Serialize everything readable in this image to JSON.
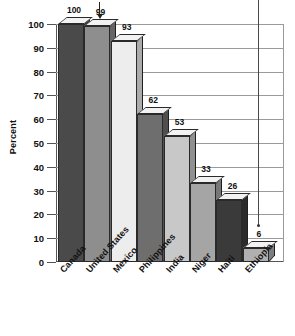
{
  "chart_data": {
    "type": "bar",
    "title": "",
    "subtitle": "",
    "xlabel": "",
    "ylabel": "Percent",
    "ylim": [
      0,
      100
    ],
    "ytick_step": 10,
    "grid": true,
    "legend": "none",
    "style": "3d-column",
    "categories": [
      "Canada",
      "United States",
      "Mexico",
      "Philippines",
      "India",
      "Niger",
      "Haiti",
      "Ethiopia"
    ],
    "values": [
      100,
      99,
      93,
      62,
      53,
      33,
      26,
      6
    ],
    "value_labels": [
      "100",
      "99",
      "93",
      "62",
      "53",
      "33",
      "26",
      "6"
    ],
    "ytick_labels": [
      "100",
      "90",
      "80",
      "70",
      "60",
      "50",
      "40",
      "30",
      "20",
      "10",
      "0"
    ],
    "bar_colors": [
      "#4a4a4a",
      "#8e8e8e",
      "#ededed",
      "#6e6e6e",
      "#c8c8c8",
      "#a5a5a5",
      "#3a3a3a",
      "#b0b0b0"
    ],
    "annotations": [
      {
        "name": "down-arrow-over-united-states",
        "type": "arrow-down",
        "target_category": "United States"
      },
      {
        "name": "vertical-pointer-over-ethiopia",
        "type": "vertical-line",
        "target_category": "Ethiopia"
      }
    ]
  },
  "axis": {
    "y_label": "Percent"
  }
}
